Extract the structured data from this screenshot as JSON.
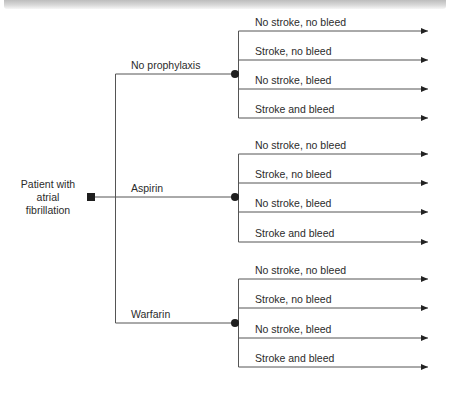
{
  "diagram": {
    "type": "decision-tree",
    "root": {
      "label_lines": [
        "Patient with",
        "atrial",
        "fibrillation"
      ],
      "node_type": "decision-square"
    },
    "branches": [
      {
        "label": "No prophylaxis",
        "node_type": "chance-circle",
        "outcomes": [
          "No stroke, no bleed",
          "Stroke, no bleed",
          "No stroke, bleed",
          "Stroke and bleed"
        ]
      },
      {
        "label": "Aspirin",
        "node_type": "chance-circle",
        "outcomes": [
          "No stroke, no bleed",
          "Stroke, no bleed",
          "No stroke, bleed",
          "Stroke and bleed"
        ]
      },
      {
        "label": "Warfarin",
        "node_type": "chance-circle",
        "outcomes": [
          "No stroke, no bleed",
          "Stroke, no bleed",
          "No stroke, bleed",
          "Stroke and bleed"
        ]
      }
    ]
  },
  "colors": {
    "line": "#555555",
    "node": "#1e1e1e",
    "text": "#2b2b2b"
  }
}
